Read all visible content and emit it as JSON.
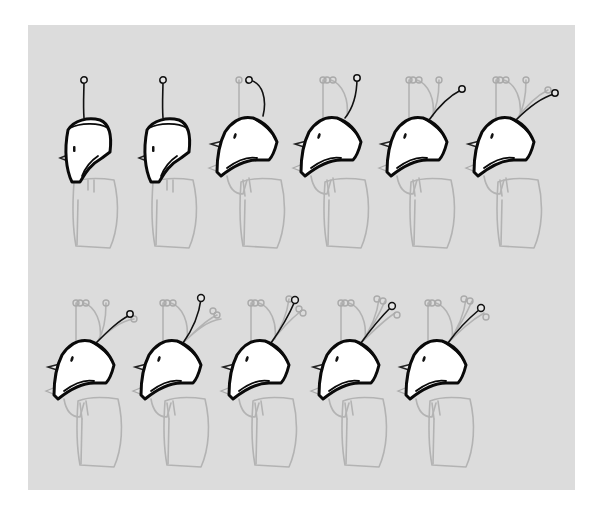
{
  "sheet": {
    "title": "Robot head animation frames",
    "background": "#ffffff",
    "panel_color": "#dcdcdc",
    "ink_color": "#0a0a0a",
    "ghost_color": "#b3b3b3"
  },
  "rows": [
    {
      "frames": [
        {
          "id": 1,
          "x": 58,
          "y": 80,
          "pose": "upright",
          "antenna": "straight"
        },
        {
          "id": 2,
          "x": 137,
          "y": 80,
          "pose": "upright",
          "antenna": "straight"
        },
        {
          "id": 3,
          "x": 213,
          "y": 80,
          "pose": "tilted",
          "antenna": "arched"
        },
        {
          "id": 4,
          "x": 297,
          "y": 80,
          "pose": "tilted",
          "antenna": "bent-up"
        },
        {
          "id": 5,
          "x": 383,
          "y": 80,
          "pose": "tilted",
          "antenna": "angled"
        },
        {
          "id": 6,
          "x": 470,
          "y": 80,
          "pose": "tilted",
          "antenna": "angled-far"
        }
      ]
    },
    {
      "frames": [
        {
          "id": 7,
          "x": 50,
          "y": 303,
          "pose": "tilted",
          "antenna": "angled"
        },
        {
          "id": 8,
          "x": 137,
          "y": 303,
          "pose": "tilted",
          "antenna": "upright-cluster"
        },
        {
          "id": 9,
          "x": 225,
          "y": 303,
          "pose": "tilted",
          "antenna": "cluster"
        },
        {
          "id": 10,
          "x": 315,
          "y": 303,
          "pose": "tilted",
          "antenna": "cluster"
        },
        {
          "id": 11,
          "x": 402,
          "y": 303,
          "pose": "tilted",
          "antenna": "cluster"
        }
      ]
    }
  ]
}
